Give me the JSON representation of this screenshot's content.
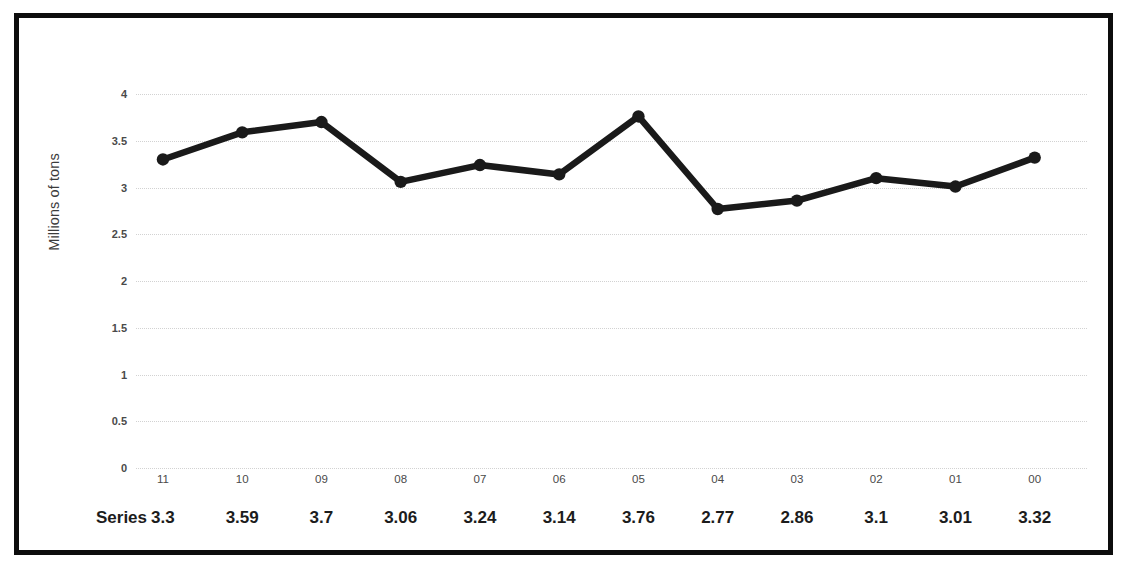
{
  "figure": {
    "y_axis_title": "Millions of tons",
    "border_color": "#0d0d0d",
    "line_color": "#1a1a1a",
    "grid_color": "#d2d2d2",
    "top_caption_fragment": "figure"
  },
  "table": {
    "row_label": "Series"
  },
  "chart_data": {
    "type": "line",
    "title": "",
    "subtitle": "",
    "xlabel": "",
    "ylabel": "Millions of tons",
    "categories": [
      "11",
      "10",
      "09",
      "08",
      "07",
      "06",
      "05",
      "04",
      "03",
      "02",
      "01",
      "00"
    ],
    "series": [
      {
        "name": "Series",
        "values": [
          3.3,
          3.59,
          3.7,
          3.06,
          3.24,
          3.14,
          3.76,
          2.77,
          2.86,
          3.1,
          3.01,
          3.32
        ]
      }
    ],
    "ylim": [
      0,
      4
    ],
    "yticks": [
      0,
      0.5,
      1,
      1.5,
      2,
      2.5,
      3,
      3.5,
      4
    ],
    "ytick_labels": [
      "0",
      "0.5",
      "1",
      "1.5",
      "2",
      "2.5",
      "3",
      "3.5",
      "4"
    ],
    "grid": true,
    "grid_axis": "y",
    "legend": false,
    "legend_position": "none",
    "markers": "circle",
    "data_table_visible": true
  }
}
